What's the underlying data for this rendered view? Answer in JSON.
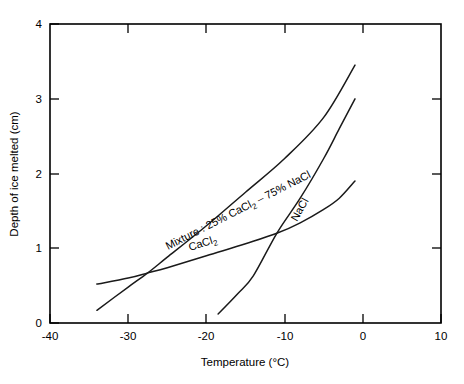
{
  "chart_data": {
    "type": "line",
    "title": "",
    "xlabel": "Temperature (°C)",
    "ylabel": "Depth of ice melted (cm)",
    "xlim": [
      -40,
      10
    ],
    "ylim": [
      0,
      4
    ],
    "xticks": [
      -40,
      -30,
      -20,
      -10,
      0,
      10
    ],
    "xticklabels": [
      "-40",
      "-30",
      "-20",
      "-10",
      "0",
      "10"
    ],
    "yticks": [
      0,
      1,
      2,
      3,
      4
    ],
    "yticklabels": [
      "0",
      "1",
      "2",
      "3",
      "4"
    ],
    "grid": false,
    "legend": "inline-curve-labels",
    "series": [
      {
        "name": "Mixture : 25% CaCl2 - 75% NaCl",
        "label_text": "Mixture : 25% CaCl",
        "label_sub": "2",
        "label_tail": " – 75% NaCl",
        "label_rotation": -27,
        "points": [
          [
            -34.0,
            0.17
          ],
          [
            -30.0,
            0.48
          ],
          [
            -27.5,
            0.67
          ],
          [
            -25.0,
            0.88
          ],
          [
            -20.0,
            1.3
          ],
          [
            -15.0,
            1.75
          ],
          [
            -10.0,
            2.2
          ],
          [
            -5.0,
            2.75
          ],
          [
            -1.0,
            3.45
          ]
        ]
      },
      {
        "name": "CaCl2",
        "label_text": "CaCl",
        "label_sub": "2",
        "label_tail": "",
        "label_rotation": -18,
        "points": [
          [
            -34.0,
            0.52
          ],
          [
            -30.0,
            0.6
          ],
          [
            -27.5,
            0.67
          ],
          [
            -25.0,
            0.74
          ],
          [
            -20.0,
            0.9
          ],
          [
            -15.0,
            1.06
          ],
          [
            -11.0,
            1.2
          ],
          [
            -8.0,
            1.34
          ],
          [
            -5.0,
            1.52
          ],
          [
            -3.0,
            1.67
          ],
          [
            -1.0,
            1.9
          ]
        ]
      },
      {
        "name": "NaCl",
        "label_text": "NaCl",
        "label_sub": "",
        "label_tail": "",
        "label_rotation": -61,
        "points": [
          [
            -18.5,
            0.12
          ],
          [
            -16.0,
            0.39
          ],
          [
            -14.0,
            0.63
          ],
          [
            -11.0,
            1.2
          ],
          [
            -8.0,
            1.67
          ],
          [
            -5.0,
            2.2
          ],
          [
            -3.0,
            2.6
          ],
          [
            -1.0,
            3.0
          ]
        ]
      }
    ]
  },
  "axis": {
    "x_title": "Temperature (°C)",
    "y_title": "Depth of ice melted (cm)",
    "x_labels": [
      "-40",
      "-30",
      "-20",
      "-10",
      "0",
      "10"
    ],
    "y_labels": [
      "0",
      "1",
      "2",
      "3",
      "4"
    ]
  },
  "series_labels": {
    "mixture_main": "Mixture : 25% CaCl",
    "mixture_sub": "2",
    "mixture_tail": " – 75% NaCl",
    "cacl2_main": "CaCl",
    "cacl2_sub": "2",
    "nacl_main": "NaCl"
  },
  "colors": {
    "line": "#1a1a1a",
    "axis": "#000000",
    "background": "#ffffff"
  }
}
